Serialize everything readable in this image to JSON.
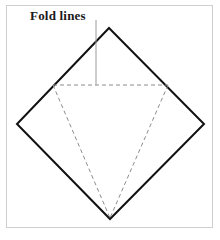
{
  "figure": {
    "background_color": "#ffffff",
    "frame": {
      "name": "figure-border",
      "color": "#cfcfcf",
      "x": 6,
      "y": 5,
      "width": 207,
      "height": 223,
      "stroke_width": 1
    },
    "annotation": {
      "label": "Fold lines",
      "color": "#1a1a1a",
      "leader_line": {
        "color": "#9a9a9a",
        "x1": 96,
        "y1": 20,
        "x2": 96,
        "y2": 85,
        "stroke_width": 1
      }
    },
    "shapes": [
      {
        "name": "paper-square-diamond",
        "type": "polygon",
        "style": "solid",
        "color": "#111111",
        "stroke_width": 2,
        "fill": "none",
        "points": "109,28 204,124 110,219 17,124"
      },
      {
        "name": "fold-line-horizontal",
        "type": "line",
        "style": "dashed",
        "color": "#8c8c8c",
        "stroke_width": 1,
        "dash": "4,3",
        "points": "53,85 168,85"
      },
      {
        "name": "fold-line-left",
        "type": "line",
        "style": "dashed",
        "color": "#8c8c8c",
        "stroke_width": 1,
        "dash": "4,3",
        "points": "53,85 110,218"
      },
      {
        "name": "fold-line-right",
        "type": "line",
        "style": "dashed",
        "color": "#8c8c8c",
        "stroke_width": 1,
        "dash": "4,3",
        "points": "168,85 110,218"
      }
    ]
  }
}
